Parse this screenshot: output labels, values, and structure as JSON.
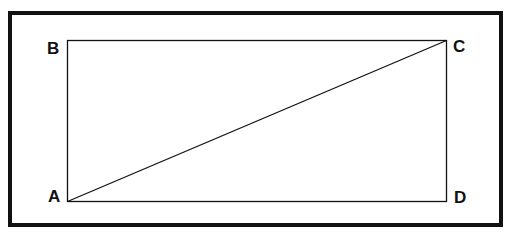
{
  "diagram": {
    "type": "rectangle-with-diagonal",
    "vertices": [
      {
        "label": "A",
        "x": 67,
        "y": 201
      },
      {
        "label": "B",
        "x": 67,
        "y": 40
      },
      {
        "label": "C",
        "x": 446,
        "y": 40
      },
      {
        "label": "D",
        "x": 446,
        "y": 201
      }
    ],
    "diagonal": [
      "A",
      "C"
    ],
    "colors": {
      "stroke": "#111111",
      "background": "#ffffff"
    }
  },
  "labels": {
    "a": "A",
    "b": "B",
    "c": "C",
    "d": "D"
  }
}
